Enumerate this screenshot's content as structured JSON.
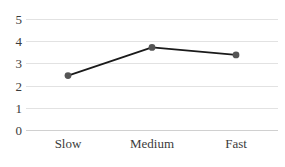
{
  "chart_data": {
    "type": "line",
    "title": "",
    "subtitle": "",
    "xlabel": "",
    "ylabel": "",
    "categories": [
      "Slow",
      "Medium",
      "Fast"
    ],
    "values": [
      2.45,
      3.72,
      3.38
    ],
    "series": [
      {
        "name": "series-1",
        "values": [
          2.45,
          3.72,
          3.38
        ]
      }
    ],
    "ylim": [
      0,
      5
    ],
    "y_ticks": [
      0,
      1,
      2,
      3,
      4,
      5
    ],
    "y_tick_labels": [
      "0",
      "1",
      "2",
      "3",
      "4",
      "5"
    ],
    "grid": true,
    "grid_axis": "y",
    "legend": false,
    "legend_position": "none",
    "annotations": [],
    "marker": "circle",
    "line_color": "#1a1a1a",
    "marker_color": "#555555",
    "grid_color": "#e2e2e2",
    "text_color": "#3b3b3b",
    "background_color": "#ffffff"
  }
}
